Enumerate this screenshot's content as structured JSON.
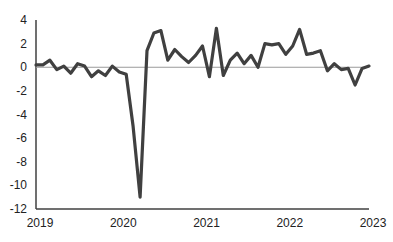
{
  "chart_data": {
    "type": "line",
    "title": "",
    "xlabel": "",
    "ylabel": "",
    "ylim": [
      -12,
      4
    ],
    "yticks": [
      4,
      2,
      0,
      -2,
      -4,
      -6,
      -8,
      -10,
      -12
    ],
    "ytick_labels": [
      "4",
      "2",
      "0",
      "-2",
      "-4",
      "-6",
      "-8",
      "-10",
      "-12"
    ],
    "xticks": [
      "2019",
      "2020",
      "2021",
      "2022",
      "2023"
    ],
    "grid": false,
    "legend": null,
    "zero_line": true,
    "line_color": "#404040",
    "axis_color": "#404040",
    "zero_line_color": "#9a9a9a",
    "x": [
      "2019-01",
      "2019-02",
      "2019-03",
      "2019-04",
      "2019-05",
      "2019-06",
      "2019-07",
      "2019-08",
      "2019-09",
      "2019-10",
      "2019-11",
      "2019-12",
      "2020-01",
      "2020-02",
      "2020-03",
      "2020-04",
      "2020-05",
      "2020-06",
      "2020-07",
      "2020-08",
      "2020-09",
      "2020-10",
      "2020-11",
      "2020-12",
      "2021-01",
      "2021-02",
      "2021-03",
      "2021-04",
      "2021-05",
      "2021-06",
      "2021-07",
      "2021-08",
      "2021-09",
      "2021-10",
      "2021-11",
      "2021-12",
      "2022-01",
      "2022-02",
      "2022-03",
      "2022-04",
      "2022-05",
      "2022-06",
      "2022-07",
      "2022-08",
      "2022-09",
      "2022-10",
      "2022-11",
      "2022-12",
      "2023-01"
    ],
    "series": [
      {
        "name": "value",
        "values": [
          0.2,
          0.2,
          0.6,
          -0.2,
          0.1,
          -0.5,
          0.3,
          0.1,
          -0.8,
          -0.3,
          -0.7,
          0.1,
          -0.4,
          -0.6,
          -5.0,
          -11.0,
          1.4,
          2.9,
          3.1,
          0.6,
          1.5,
          0.9,
          0.4,
          1.0,
          1.8,
          -0.8,
          3.3,
          -0.7,
          0.6,
          1.2,
          0.3,
          1.0,
          0.0,
          2.0,
          1.9,
          2.0,
          1.1,
          1.8,
          3.2,
          1.1,
          1.2,
          1.4,
          -0.3,
          0.3,
          -0.2,
          -0.1,
          -1.5,
          -0.1,
          0.1
        ]
      }
    ]
  }
}
